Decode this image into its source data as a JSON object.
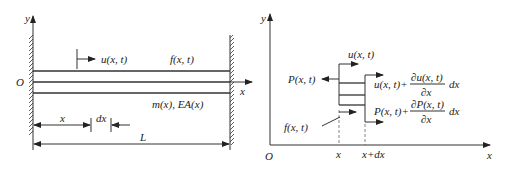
{
  "left_figure": {
    "axis_y_label": "y",
    "axis_x_label": "x",
    "origin_label": "O",
    "displacement_label": "u(x, t)",
    "force_label": "f(x, t)",
    "property_label": "m(x), EA(x)",
    "dim_x_label": "x",
    "dim_dx_label": "dx",
    "dim_length_label": "L"
  },
  "right_figure": {
    "axis_y_label": "y",
    "axis_x_label": "x",
    "origin_label": "O",
    "disp_left_label": "u(x, t)",
    "force_left_label": "P(x, t)",
    "disp_right_label": "u(x, t)+",
    "disp_right_num": "∂u(x, t)",
    "disp_right_den": "∂x",
    "disp_right_tail": "dx",
    "force_right_label": "P(x, t)+",
    "force_right_num": "∂P(x, t)",
    "force_right_den": "∂x",
    "force_right_tail": "dx",
    "body_force_label": "f(x, t)",
    "tick_x_label": "x",
    "tick_xdx_label": "x+dx"
  }
}
